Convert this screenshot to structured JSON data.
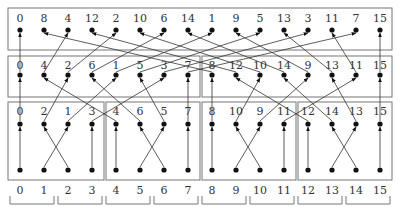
{
  "diagram": {
    "type": "bit-reversal permutation network",
    "colors": {
      "line": "#333333",
      "box": "#777777",
      "node": "#111111",
      "background": "#ffffff"
    },
    "column_x": [
      20,
      44,
      68,
      92,
      116,
      140,
      164,
      188,
      212,
      236,
      260,
      284,
      308,
      332,
      356,
      380
    ],
    "layers": [
      {
        "name": "top",
        "label_y": 18,
        "node_y": 30,
        "labels": [
          "0",
          "8",
          "4",
          "12",
          "2",
          "10",
          "6",
          "14",
          "1",
          "9",
          "5",
          "13",
          "3",
          "11",
          "7",
          "15"
        ],
        "boxes": [
          [
            8,
            8,
            384,
            42
          ]
        ]
      },
      {
        "name": "middle",
        "label_y": 65,
        "node_y": 75,
        "labels": [
          "0",
          "4",
          "2",
          "6",
          "1",
          "5",
          "3",
          "7",
          "8",
          "12",
          "10",
          "14",
          "9",
          "13",
          "11",
          "15"
        ],
        "boxes": [
          [
            8,
            56,
            192,
            41
          ],
          [
            202,
            56,
            190,
            41
          ]
        ]
      },
      {
        "name": "lower",
        "label_y": 111,
        "node_y": 124,
        "labels": [
          "0",
          "2",
          "1",
          "3",
          "4",
          "6",
          "5",
          "7",
          "8",
          "10",
          "9",
          "11",
          "12",
          "14",
          "13",
          "15"
        ],
        "boxes": [
          [
            8,
            102,
            96,
            78
          ],
          [
            106,
            102,
            94,
            78
          ],
          [
            202,
            102,
            94,
            78
          ],
          [
            298,
            102,
            94,
            78
          ]
        ]
      },
      {
        "name": "inputs",
        "node_y": 170,
        "labels": [
          "0",
          "1",
          "2",
          "3",
          "4",
          "5",
          "6",
          "7",
          "8",
          "9",
          "10",
          "11",
          "12",
          "13",
          "14",
          "15"
        ]
      }
    ],
    "bottom_labels": {
      "y": 190,
      "values": [
        "0",
        "1",
        "2",
        "3",
        "4",
        "5",
        "6",
        "7",
        "8",
        "9",
        "10",
        "11",
        "12",
        "13",
        "14",
        "15"
      ]
    },
    "brackets": [
      [
        0,
        1
      ],
      [
        2,
        3
      ],
      [
        4,
        5
      ],
      [
        6,
        7
      ],
      [
        8,
        9
      ],
      [
        10,
        11
      ],
      [
        12,
        13
      ],
      [
        14,
        15
      ]
    ]
  }
}
